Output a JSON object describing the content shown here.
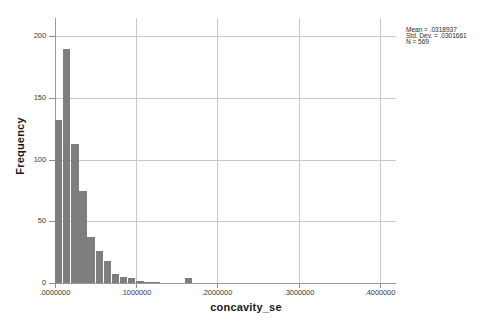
{
  "chart_data": {
    "type": "bar",
    "title": "",
    "xlabel": "concavity_se",
    "ylabel": "Frequency",
    "xlim": [
      0.0,
      0.42
    ],
    "ylim": [
      0,
      215
    ],
    "grid": true,
    "bin_width": 0.01,
    "categories": [
      "0.000-0.010",
      "0.010-0.020",
      "0.020-0.030",
      "0.030-0.040",
      "0.040-0.050",
      "0.050-0.060",
      "0.060-0.070",
      "0.070-0.080",
      "0.080-0.090",
      "0.090-0.100",
      "0.100-0.110",
      "0.110-0.120",
      "0.120-0.130",
      "0.130-0.140",
      "0.140-0.150",
      "0.150-0.160",
      "0.160-0.170",
      "0.170-0.180"
    ],
    "bin_starts": [
      0.0,
      0.01,
      0.02,
      0.03,
      0.04,
      0.05,
      0.06,
      0.07,
      0.08,
      0.09,
      0.1,
      0.11,
      0.12,
      0.13,
      0.14,
      0.15,
      0.16,
      0.17
    ],
    "values": [
      132,
      190,
      113,
      75,
      37,
      26,
      18,
      7,
      5,
      4,
      2,
      1,
      1,
      0,
      0,
      0,
      4,
      0
    ],
    "xticks": [
      0.0,
      0.1,
      0.2,
      0.3,
      0.4
    ],
    "xticklabels": [
      ".0000000",
      ".1000000",
      ".2000000",
      ".3000000",
      ".4000000"
    ],
    "yticks": [
      0,
      50,
      100,
      150,
      200
    ],
    "yticklabels": [
      "0",
      "50",
      "100",
      "150",
      "200"
    ],
    "bar_color": "#7e7e7e",
    "grid_color": "#c8c8c8",
    "axis_color": "#9a9a9a",
    "background": "#ffffff"
  },
  "annotation": {
    "mean_line": "Mean = .0318937",
    "stddev_line": "Std. Dev. = .0301661",
    "n_line": "N = 569"
  }
}
